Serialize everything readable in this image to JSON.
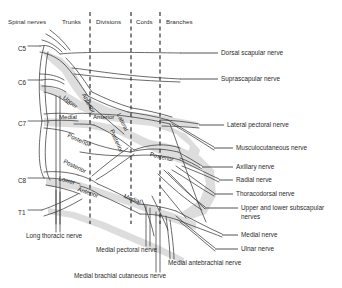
{
  "figure": {
    "stroke_color": "#3a3a3a",
    "shadow_color": "#c9c9c9",
    "text_color": "#2b2b2b"
  },
  "columns": [
    {
      "label": "Spinal nerves",
      "x": 8,
      "y": 18
    },
    {
      "label": "Trunks",
      "x": 62,
      "y": 18
    },
    {
      "label": "Divisions",
      "x": 96,
      "y": 18
    },
    {
      "label": "Cords",
      "x": 136,
      "y": 18
    },
    {
      "label": "Branches",
      "x": 166,
      "y": 18
    }
  ],
  "dividers": [
    {
      "name": "trunks-divisions-divider",
      "x": 90,
      "y1": 12,
      "y2": 224
    },
    {
      "name": "divisions-cords-divider",
      "x": 131,
      "y1": 12,
      "y2": 224
    },
    {
      "name": "cords-branches-divider",
      "x": 160,
      "y1": 12,
      "y2": 224
    }
  ],
  "roots": [
    {
      "label": "C5",
      "x": 18,
      "y": 45
    },
    {
      "label": "C6",
      "x": 18,
      "y": 79
    },
    {
      "label": "C7",
      "x": 18,
      "y": 120
    },
    {
      "label": "C8",
      "x": 18,
      "y": 177
    },
    {
      "label": "T1",
      "x": 18,
      "y": 209
    }
  ],
  "inline_labels": [
    {
      "text": "Upper",
      "x": 64,
      "y": 93,
      "rot": 38
    },
    {
      "text": "Anterior",
      "x": 84,
      "y": 90,
      "rot": 62
    },
    {
      "text": "Medial",
      "x": 59,
      "y": 113,
      "rot": 0
    },
    {
      "text": "Anterior",
      "x": 93,
      "y": 113,
      "rot": 0
    },
    {
      "text": "Lateral",
      "x": 119,
      "y": 110,
      "rot": 64
    },
    {
      "text": "Posterior",
      "x": 68,
      "y": 131,
      "rot": 24
    },
    {
      "text": "Posterior",
      "x": 112,
      "y": 126,
      "rot": 66
    },
    {
      "text": "Posterior",
      "x": 150,
      "y": 150,
      "rot": 14
    },
    {
      "text": "Posterior",
      "x": 64,
      "y": 157,
      "rot": 26
    },
    {
      "text": "Lower",
      "x": 59,
      "y": 174,
      "rot": 17
    },
    {
      "text": "Anterior",
      "x": 78,
      "y": 185,
      "rot": 19
    },
    {
      "text": "Medial",
      "x": 124,
      "y": 192,
      "rot": 20
    }
  ],
  "right_labels": [
    {
      "name": "dorsal-scapular-nerve",
      "text": "Dorsal scapular nerve",
      "x": 221,
      "y": 49,
      "leader_x1": 180,
      "leader_x2": 218,
      "leader_y": 53
    },
    {
      "name": "suprascapular-nerve",
      "text": "Suprascapular nerve",
      "x": 221,
      "y": 75,
      "leader_x1": 180,
      "leader_x2": 218,
      "leader_y": 79
    },
    {
      "name": "lateral-pectoral-nerve",
      "text": "Lateral pectoral nerve",
      "x": 227,
      "y": 121,
      "leader_x1": 199,
      "leader_x2": 224,
      "leader_y": 125
    },
    {
      "name": "musculocutaneous-nerve",
      "text": "Musculocutaneous nerve",
      "x": 236,
      "y": 144,
      "leader_x1": 214,
      "leader_x2": 233,
      "leader_y": 148
    },
    {
      "name": "axillary-nerve",
      "text": "Axillary nerve",
      "x": 236,
      "y": 163,
      "leader_x1": 202,
      "leader_x2": 233,
      "leader_y": 167
    },
    {
      "name": "radial-nerve",
      "text": "Radial nerve",
      "x": 236,
      "y": 176,
      "leader_x1": 219,
      "leader_x2": 233,
      "leader_y": 180
    },
    {
      "name": "thoracodorsal-nerve",
      "text": "Thoracodorsal nerve",
      "x": 236,
      "y": 190,
      "leader_x1": 214,
      "leader_x2": 233,
      "leader_y": 194
    },
    {
      "name": "upper-lower-subscapular-nerves",
      "text": "Upper and lower subscapular",
      "text2": "nerves",
      "x": 241,
      "y": 204,
      "leader_x1": 205,
      "leader_x2": 238,
      "leader_y": 208
    },
    {
      "name": "medial-nerve",
      "text": "Medial nerve",
      "x": 241,
      "y": 231,
      "leader_x1": 222,
      "leader_x2": 238,
      "leader_y": 235
    },
    {
      "name": "ulnar-nerve",
      "text": "Ulnar nerve",
      "x": 241,
      "y": 245,
      "leader_x1": 215,
      "leader_x2": 238,
      "leader_y": 249
    }
  ],
  "bottom_labels": [
    {
      "name": "long-thoracic-nerve",
      "text": "Long thoracic nerve",
      "x": 26,
      "y": 232
    },
    {
      "name": "medial-pectoral-nerve",
      "text": "Medial pectoral nerve",
      "x": 96,
      "y": 246
    },
    {
      "name": "medial-antebrachial-nerve",
      "text": "Medial antebrachial nerve",
      "x": 168,
      "y": 259
    },
    {
      "name": "medial-brachial-cutaneous-nerve",
      "text": "Medial brachial cutaneous nerve",
      "x": 74,
      "y": 272
    }
  ]
}
